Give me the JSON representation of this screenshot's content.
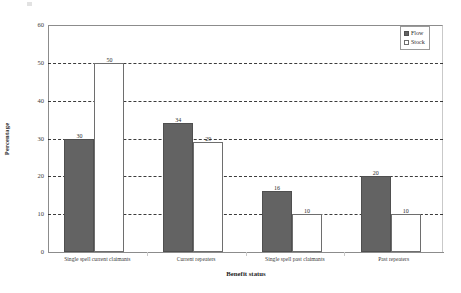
{
  "chart_data": {
    "type": "bar",
    "title": "",
    "xlabel": "Benefit status",
    "ylabel": "Percentage",
    "ylim": [
      0,
      60
    ],
    "yticks": [
      0,
      10,
      20,
      30,
      40,
      50,
      60
    ],
    "grid": true,
    "legend_position": "top-right",
    "categories": [
      "Single spell current claimants",
      "Current repeaters",
      "Single spell past claimants",
      "Past repeaters"
    ],
    "series": [
      {
        "name": "Flow",
        "color": "#636363",
        "values": [
          30,
          34,
          16,
          20
        ]
      },
      {
        "name": "Stock",
        "color": "#ffffff",
        "values": [
          50,
          29,
          10,
          10
        ]
      }
    ]
  },
  "legend": {
    "items": [
      {
        "label": "Flow",
        "swatch": "filled-square-icon"
      },
      {
        "label": "Stock",
        "swatch": "open-square-icon"
      }
    ]
  }
}
